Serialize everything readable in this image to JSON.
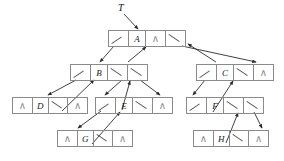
{
  "diagram": {
    "root_label": "T",
    "null_symbol": "∧",
    "empty_symbol": "",
    "colors": {
      "box_border": "#8a8a8a",
      "arrow": "#2b2b2b",
      "text": "#1a1a1a",
      "null_glyph": "#8a8a8a",
      "background": "#ffffff"
    },
    "nodes": [
      {
        "id": "A",
        "data": "A",
        "x": 108,
        "y": 30,
        "w": 78,
        "cells": [
          {
            "kind": "ptr",
            "text": ""
          },
          {
            "kind": "data",
            "text": "A"
          },
          {
            "kind": "nil",
            "text": "∧"
          },
          {
            "kind": "ptr",
            "text": ""
          }
        ]
      },
      {
        "id": "B",
        "data": "B",
        "x": 70,
        "y": 64,
        "w": 78,
        "cells": [
          {
            "kind": "ptr",
            "text": ""
          },
          {
            "kind": "data",
            "text": "B"
          },
          {
            "kind": "ptr",
            "text": ""
          },
          {
            "kind": "ptr",
            "text": ""
          }
        ]
      },
      {
        "id": "C",
        "data": "C",
        "x": 196,
        "y": 64,
        "w": 78,
        "cells": [
          {
            "kind": "ptr",
            "text": ""
          },
          {
            "kind": "data",
            "text": "C"
          },
          {
            "kind": "ptr",
            "text": ""
          },
          {
            "kind": "nil",
            "text": "∧"
          }
        ]
      },
      {
        "id": "D",
        "data": "D",
        "x": 12,
        "y": 97,
        "w": 76,
        "cells": [
          {
            "kind": "nil",
            "text": "∧"
          },
          {
            "kind": "data",
            "text": "D"
          },
          {
            "kind": "ptr",
            "text": ""
          },
          {
            "kind": "nil",
            "text": "∧"
          }
        ]
      },
      {
        "id": "E",
        "data": "E",
        "x": 95,
        "y": 97,
        "w": 78,
        "cells": [
          {
            "kind": "ptr",
            "text": ""
          },
          {
            "kind": "data",
            "text": "E"
          },
          {
            "kind": "ptr",
            "text": ""
          },
          {
            "kind": "nil",
            "text": "∧"
          }
        ]
      },
      {
        "id": "F",
        "data": "F",
        "x": 186,
        "y": 97,
        "w": 78,
        "cells": [
          {
            "kind": "ptr",
            "text": ""
          },
          {
            "kind": "data",
            "text": "F"
          },
          {
            "kind": "ptr",
            "text": ""
          },
          {
            "kind": "ptr",
            "text": ""
          }
        ]
      },
      {
        "id": "G",
        "data": "G",
        "x": 57,
        "y": 130,
        "w": 76,
        "cells": [
          {
            "kind": "nil",
            "text": "∧"
          },
          {
            "kind": "data",
            "text": "G"
          },
          {
            "kind": "ptr",
            "text": ""
          },
          {
            "kind": "nil",
            "text": "∧"
          }
        ]
      },
      {
        "id": "H",
        "data": "H",
        "x": 193,
        "y": 130,
        "w": 76,
        "cells": [
          {
            "kind": "nil",
            "text": "∧"
          },
          {
            "kind": "data",
            "text": "H"
          },
          {
            "kind": "ptr",
            "text": ""
          },
          {
            "kind": "nil",
            "text": "∧"
          }
        ]
      }
    ],
    "edges": [
      {
        "name": "edge-T-to-A",
        "from": [
          124,
          14
        ],
        "to": [
          138,
          29
        ]
      },
      {
        "name": "edge-A-to-B",
        "from": [
          114,
          46
        ],
        "to": [
          100,
          62
        ]
      },
      {
        "name": "edge-A-to-C",
        "from": [
          182,
          46
        ],
        "to": [
          256,
          62
        ]
      },
      {
        "name": "edge-B-to-D",
        "from": [
          76,
          80
        ],
        "to": [
          48,
          95
        ]
      },
      {
        "name": "edge-D-to-B",
        "from": [
          62,
          111
        ],
        "to": [
          94,
          80
        ]
      },
      {
        "name": "edge-B-to-E",
        "from": [
          122,
          80
        ],
        "to": [
          105,
          95
        ]
      },
      {
        "name": "edge-E-to-B",
        "from": [
          122,
          110
        ],
        "to": [
          130,
          81
        ]
      },
      {
        "name": "edge-B-to-rt",
        "from": [
          140,
          80
        ],
        "to": [
          160,
          95
        ]
      },
      {
        "name": "edge-B-to-A",
        "from": [
          128,
          62
        ],
        "to": [
          146,
          47
        ]
      },
      {
        "name": "edge-E-to-G",
        "from": [
          101,
          111
        ],
        "to": [
          78,
          128
        ]
      },
      {
        "name": "edge-G-to-E",
        "from": [
          92,
          144
        ],
        "to": [
          120,
          112
        ]
      },
      {
        "name": "edge-C-to-F",
        "from": [
          205,
          80
        ],
        "to": [
          193,
          95
        ]
      },
      {
        "name": "edge-F-to-C",
        "from": [
          213,
          112
        ],
        "to": [
          233,
          81
        ]
      },
      {
        "name": "edge-F-to-H",
        "from": [
          254,
          112
        ],
        "to": [
          262,
          128
        ]
      },
      {
        "name": "edge-H-to-F",
        "from": [
          226,
          143
        ],
        "to": [
          238,
          113
        ]
      },
      {
        "name": "edge-C-to-A",
        "from": [
          216,
          62
        ],
        "to": [
          188,
          44
        ]
      }
    ]
  }
}
